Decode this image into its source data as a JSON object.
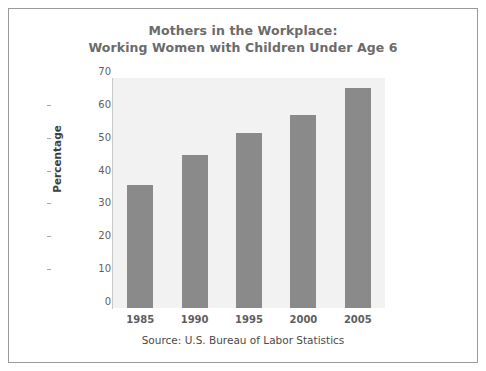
{
  "chart_data": {
    "type": "bar",
    "title": "Mothers in the Workplace: Working Women with Children Under Age 6",
    "title_lines": [
      "Mothers in the Workplace:",
      "Working Women with Children Under Age 6"
    ],
    "categories": [
      "1985",
      "1990",
      "1995",
      "2000",
      "2005"
    ],
    "values": [
      37.5,
      46.5,
      53.2,
      58.7,
      66.9
    ],
    "xlabel": "",
    "ylabel": "Percentage",
    "ylim": [
      0,
      70
    ],
    "ytick_labels": [
      "0",
      "10",
      "20",
      "30",
      "40",
      "50",
      "60",
      "70"
    ],
    "ytick_values": [
      0,
      10,
      20,
      30,
      40,
      50,
      60,
      70
    ],
    "grid": false,
    "legend": null,
    "annotation": "Source: U.S. Bureau of Labor Statistics",
    "colors": {
      "bar": "#8a8a8a",
      "plot_background": "#f2f2f2",
      "figure_background": "#ffffff",
      "title_text": "#6b6b6b",
      "tick_text": "#5e5e5e",
      "axis_line": "#c9c9c9",
      "frame_border": "#9a9a9a",
      "source_text": "#4a4a4a"
    }
  }
}
